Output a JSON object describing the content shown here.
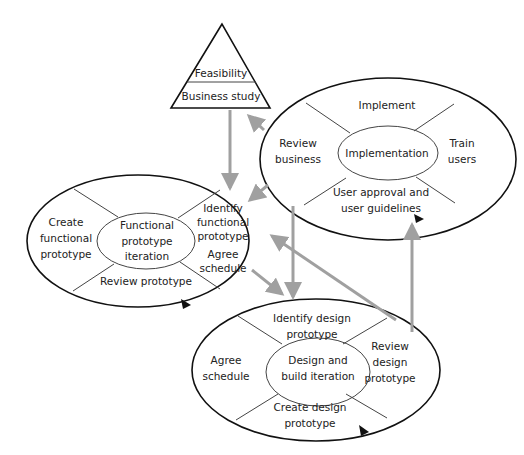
{
  "colors": {
    "outline": "#111111",
    "divider": "#444444",
    "flow_arrow": "#a0a0a0",
    "background": "#ffffff"
  },
  "feasibility": {
    "top_label": "Feasibility",
    "bottom_label": "Business study"
  },
  "implementation": {
    "center": "Implementation",
    "top": "Implement",
    "left_1": "Review",
    "left_2": "business",
    "right_1": "Train",
    "right_2": "users",
    "bottom_1": "User approval and",
    "bottom_2": "user guidelines"
  },
  "functional": {
    "center_1": "Functional",
    "center_2": "prototype",
    "center_3": "iteration",
    "left_1": "Create",
    "left_2": "functional",
    "left_3": "prototype",
    "right_1": "Identify",
    "right_2": "functional",
    "right_3": "prototype",
    "right_4": "Agree",
    "right_5": "schedule",
    "bottom": "Review prototype"
  },
  "design": {
    "center_1": "Design and",
    "center_2": "build iteration",
    "top_1": "Identify design",
    "top_2": "prototype",
    "left_1": "Agree",
    "left_2": "schedule",
    "right_1": "Review",
    "right_2": "design",
    "right_3": "prototype",
    "bottom_1": "Create design",
    "bottom_2": "prototype"
  }
}
